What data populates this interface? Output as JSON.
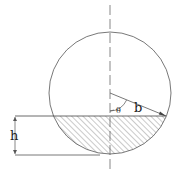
{
  "diagram": {
    "type": "circular-segment",
    "labels": {
      "height": "h",
      "radius": "b",
      "angle": "θ"
    },
    "colors": {
      "line": "#555555",
      "hatch": "#666666",
      "background": "#ffffff"
    }
  }
}
